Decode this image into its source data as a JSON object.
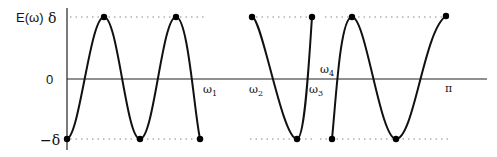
{
  "figure": {
    "y_axis_label": "E(ω)",
    "y_ticks": [
      {
        "label": "δ",
        "value": 1
      },
      {
        "label": "0",
        "value": 0
      },
      {
        "label": "−δ",
        "value": -1
      }
    ],
    "x_labels": [
      {
        "label": "ω",
        "sub": "1",
        "x": 203,
        "y": 93
      },
      {
        "label": "ω",
        "sub": "2",
        "x": 249,
        "y": 93
      },
      {
        "label": "ω",
        "sub": "3",
        "x": 309,
        "y": 93
      },
      {
        "label": "ω",
        "sub": "4",
        "x": 320,
        "y": 73
      },
      {
        "label": "π",
        "sub": "",
        "x": 445,
        "y": 92
      }
    ],
    "colors": {
      "curve": "#111111",
      "axis": "#222222",
      "dotted": "#888888"
    }
  },
  "chart_data": {
    "type": "line",
    "xlabel": "ω",
    "ylabel": "E(ω)",
    "ylim": [
      -1,
      1
    ],
    "xlim": [
      0,
      3.14159
    ],
    "bands": [
      {
        "name": "band 1",
        "range": [
          "0",
          "ω1"
        ],
        "extrema": [
          -1,
          1,
          -1,
          1,
          -1
        ]
      },
      {
        "name": "band 2",
        "range": [
          "ω2",
          "ω3"
        ],
        "extrema": [
          1,
          -1,
          1
        ]
      },
      {
        "name": "band 3",
        "range": [
          "ω4",
          "π"
        ],
        "extrema": [
          -1,
          1,
          -1,
          1
        ]
      }
    ]
  }
}
